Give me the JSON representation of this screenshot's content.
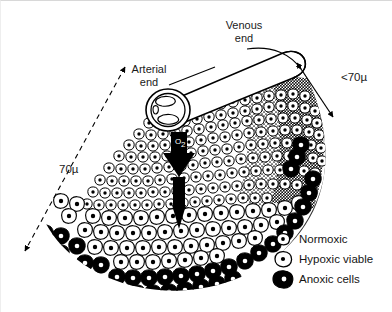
{
  "figure": {
    "title_labels": {
      "venous_end": "Venous\nend",
      "venous_end_line1": "Venous",
      "venous_end_line2": "end",
      "arterial_end_line1": "Arterial",
      "arterial_end_line2": "end"
    },
    "measurements": {
      "left_distance": "70µ",
      "right_distance": "<70µ"
    },
    "diffusion_arrow_label": "O",
    "diffusion_arrow_sub": "2"
  },
  "legend": {
    "items": [
      {
        "label": "Normoxic",
        "icon": "normoxic-cell-icon",
        "fill": "#ffffff",
        "stroke": "#000000",
        "nucleus": "#000000"
      },
      {
        "label": "Hypoxic viable",
        "icon": "hypoxic-cell-icon",
        "fill": "#ffffff",
        "stroke": "#000000",
        "nucleus": "#000000"
      },
      {
        "label": "Anoxic cells",
        "icon": "anoxic-cell-icon",
        "fill": "#000000",
        "stroke": "#000000",
        "nucleus": "#ffffff"
      }
    ]
  },
  "colors": {
    "background": "#ffffff",
    "ink": "#000000",
    "text": "#1a1a1a",
    "border": "#d8d8d8"
  }
}
